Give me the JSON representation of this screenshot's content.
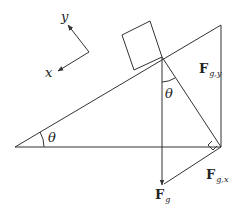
{
  "diagram": {
    "type": "inclined-plane-free-body",
    "axes": {
      "x_label": "x",
      "y_label": "y"
    },
    "angles": {
      "incline_angle": "θ",
      "force_angle": "θ"
    },
    "forces": {
      "gravity": {
        "symbol": "F",
        "subscript": "g"
      },
      "gravity_y": {
        "symbol": "F",
        "subscript": "g,y"
      },
      "gravity_x": {
        "symbol": "F",
        "subscript": "g,x"
      }
    },
    "colors": {
      "line": "#333333",
      "background": "#ffffff"
    }
  }
}
